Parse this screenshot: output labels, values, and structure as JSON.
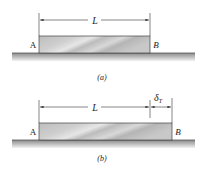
{
  "figure_a": {
    "caption": "(a)",
    "left_label": "A",
    "right_label": "B",
    "length_label": "L"
  },
  "figure_b": {
    "caption": "(b)",
    "left_label": "A",
    "right_label": "B",
    "length_label": "L",
    "expansion_label": "δ",
    "expansion_subscript": "T"
  },
  "colors": {
    "bar_fill": "#c4c4c4",
    "ground": "#8a8a8a",
    "line": "#333333"
  }
}
